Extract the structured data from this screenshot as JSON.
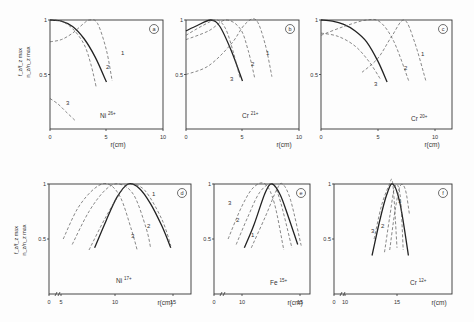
{
  "figure": {
    "y_axis_label": "f_z/f_z,max · n_z/n_z,max",
    "x_axis_label": "r(cm)"
  },
  "chart_data": [
    {
      "type": "line",
      "panel": "a",
      "ion": "Ni",
      "charge": "26+",
      "xlabel": "r(cm)",
      "ylabel": "f_z/f_z max, n_z/n_z max",
      "xlim": [
        0,
        10
      ],
      "ylim": [
        0,
        1
      ],
      "x_ticks": [
        "0",
        "5",
        "10"
      ],
      "y_ticks": [
        "0.5",
        "1"
      ],
      "axis_break": false,
      "series": [
        {
          "name": "n_z/n_z max (solid)",
          "style": "solid",
          "x": [
            0,
            1,
            2,
            3,
            4,
            5
          ],
          "y": [
            1.0,
            0.99,
            0.94,
            0.83,
            0.66,
            0.43
          ]
        },
        {
          "name": "1",
          "style": "dashed",
          "x": [
            0,
            1,
            2,
            3,
            3.5,
            4.2,
            5,
            5.5
          ],
          "y": [
            0.8,
            0.82,
            0.88,
            0.97,
            1.0,
            0.97,
            0.72,
            0.44
          ]
        },
        {
          "name": "2",
          "style": "dashed",
          "x": [
            0,
            1,
            2,
            3,
            3.6,
            4.1
          ],
          "y": [
            1.0,
            0.99,
            0.92,
            0.78,
            0.6,
            0.38
          ]
        },
        {
          "name": "3",
          "style": "dashed",
          "x": [
            0,
            0.7,
            1.4,
            2.2
          ],
          "y": [
            0.28,
            0.23,
            0.16,
            0.08
          ]
        }
      ]
    },
    {
      "type": "line",
      "panel": "b",
      "ion": "Cr",
      "charge": "21+",
      "xlabel": "r(cm)",
      "xlim": [
        0,
        10
      ],
      "ylim": [
        0,
        1
      ],
      "x_ticks": [
        "0",
        "5",
        "10"
      ],
      "y_ticks": [
        "0.5",
        "1"
      ],
      "axis_break": false,
      "series": [
        {
          "name": "n_z/n_z max (solid)",
          "style": "solid",
          "x": [
            0,
            1,
            2.2,
            3,
            4,
            5
          ],
          "y": [
            0.9,
            0.95,
            1.0,
            0.94,
            0.72,
            0.44
          ]
        },
        {
          "name": "1",
          "style": "dashed",
          "x": [
            0,
            2,
            4,
            5.2,
            6.2,
            7,
            7.6
          ],
          "y": [
            0.5,
            0.58,
            0.78,
            0.96,
            1.0,
            0.78,
            0.48
          ]
        },
        {
          "name": "2",
          "style": "dashed",
          "x": [
            0,
            2,
            3.5,
            4.8,
            5.5,
            6.1
          ],
          "y": [
            0.82,
            0.9,
            1.0,
            0.92,
            0.72,
            0.46
          ]
        },
        {
          "name": "3",
          "style": "dashed",
          "x": [
            0,
            1.5,
            2.7,
            3.5,
            4.2,
            4.8
          ],
          "y": [
            0.86,
            0.95,
            1.0,
            0.92,
            0.7,
            0.46
          ]
        }
      ]
    },
    {
      "type": "line",
      "panel": "c",
      "ion": "Cr",
      "charge": "20+",
      "xlabel": "r(cm)",
      "xlim": [
        0,
        10
      ],
      "ylim": [
        0,
        1
      ],
      "x_ticks": [
        "0",
        "5",
        "10"
      ],
      "y_ticks": [
        "0.5",
        "1"
      ],
      "axis_break": false,
      "series": [
        {
          "name": "n_z/n_z max (solid)",
          "style": "solid",
          "x": [
            0,
            1,
            2,
            3,
            4,
            5,
            5.8
          ],
          "y": [
            1.0,
            0.99,
            0.96,
            0.9,
            0.8,
            0.62,
            0.43
          ]
        },
        {
          "name": "1",
          "style": "dashed",
          "x": [
            3.6,
            5,
            6.2,
            7.3,
            8.2,
            9.2
          ],
          "y": [
            0.52,
            0.65,
            0.85,
            1.0,
            0.8,
            0.44
          ]
        },
        {
          "name": "2",
          "style": "dashed",
          "x": [
            0,
            2,
            4,
            5.2,
            6.4,
            7.7
          ],
          "y": [
            0.86,
            0.94,
            1.0,
            0.98,
            0.8,
            0.44
          ]
        },
        {
          "name": "3",
          "style": "dashed",
          "x": [
            0,
            1.5,
            3,
            4.2,
            5.2
          ],
          "y": [
            0.88,
            0.85,
            0.76,
            0.62,
            0.46
          ]
        }
      ]
    },
    {
      "type": "line",
      "panel": "d",
      "ion": "Ni",
      "charge": "17+",
      "xlabel": "r(cm)",
      "xlim": [
        0,
        16.5
      ],
      "ylim": [
        0,
        1
      ],
      "x_ticks": [
        "0",
        "5",
        "10",
        "15"
      ],
      "y_ticks": [
        "0.5",
        "1"
      ],
      "axis_break": true,
      "series": [
        {
          "name": "n_z/n_z max (solid)",
          "style": "solid",
          "x": [
            8,
            9,
            10,
            11,
            12,
            13,
            14,
            14.8
          ],
          "y": [
            0.42,
            0.66,
            0.88,
            1.0,
            0.96,
            0.82,
            0.62,
            0.42
          ]
        },
        {
          "name": "1",
          "style": "dashed",
          "x": [
            7.5,
            9,
            10.5,
            11.2,
            12.5,
            14,
            14.8
          ],
          "y": [
            0.4,
            0.7,
            0.95,
            1.0,
            0.94,
            0.68,
            0.44
          ]
        },
        {
          "name": "2",
          "style": "dashed",
          "x": [
            6,
            7.5,
            9,
            10.2,
            11.5,
            12.6,
            13
          ],
          "y": [
            0.45,
            0.75,
            0.95,
            1.0,
            0.9,
            0.6,
            0.42
          ]
        },
        {
          "name": "3",
          "style": "dashed",
          "x": [
            5.2,
            6.5,
            8,
            9.2,
            10.3,
            11.3,
            11.8
          ],
          "y": [
            0.5,
            0.78,
            0.96,
            1.0,
            0.88,
            0.58,
            0.4
          ]
        }
      ]
    },
    {
      "type": "line",
      "panel": "e",
      "ion": "Fe",
      "charge": "15+",
      "xlabel": "r(cm)",
      "xlim": [
        0,
        16.5
      ],
      "ylim": [
        0,
        1
      ],
      "x_ticks": [
        "0",
        "10",
        "15"
      ],
      "y_ticks": [
        "0.5",
        "1"
      ],
      "axis_break": true,
      "series": [
        {
          "name": "n_z/n_z max (solid)",
          "style": "solid",
          "x": [
            10.2,
            11,
            12,
            12.6,
            13.3,
            14,
            14.8
          ],
          "y": [
            0.42,
            0.62,
            0.92,
            1.0,
            0.9,
            0.7,
            0.45
          ]
        },
        {
          "name": "1",
          "style": "dashed",
          "x": [
            10.8,
            12,
            13,
            13.5,
            14.2,
            15.1
          ],
          "y": [
            0.42,
            0.7,
            0.95,
            1.0,
            0.85,
            0.44
          ]
        },
        {
          "name": "2",
          "style": "dashed",
          "x": [
            9.5,
            10.5,
            11.5,
            12.5,
            13.2,
            14.3
          ],
          "y": [
            0.45,
            0.7,
            0.92,
            1.0,
            0.88,
            0.42
          ]
        },
        {
          "name": "3",
          "style": "dashed",
          "x": [
            8.8,
            10,
            11,
            12,
            12.8,
            13.6
          ],
          "y": [
            0.5,
            0.8,
            0.97,
            1.0,
            0.82,
            0.4
          ]
        }
      ]
    },
    {
      "type": "line",
      "panel": "f",
      "ion": "Cr",
      "charge": "12+",
      "xlabel": "r(cm)",
      "xlim": [
        0,
        20.5
      ],
      "ylim": [
        0,
        1
      ],
      "x_ticks": [
        "0",
        "10",
        "15"
      ],
      "y_ticks": [
        "0.5",
        "1"
      ],
      "axis_break": true,
      "series": [
        {
          "name": "n_z/n_z max (solid)",
          "style": "solid",
          "x": [
            12.6,
            13.3,
            14,
            14.6,
            15.3,
            16.1
          ],
          "y": [
            0.35,
            0.65,
            0.9,
            1.0,
            0.82,
            0.35
          ]
        },
        {
          "name": "1",
          "style": "dashed",
          "x": [
            14.3,
            14.8,
            15.3,
            15.8,
            16.2
          ],
          "y": [
            0.4,
            0.75,
            0.98,
            0.95,
            0.72
          ]
        },
        {
          "name": "2",
          "style": "dashed",
          "x": [
            13.8,
            14.3,
            14.8,
            15.3,
            15.6
          ],
          "y": [
            0.38,
            0.7,
            0.98,
            0.9,
            0.4
          ]
        },
        {
          "name": "3",
          "style": "dashed",
          "x": [
            12.8,
            13.5,
            14.2,
            14.6,
            15.0
          ],
          "y": [
            0.5,
            0.8,
            0.98,
            1.0,
            0.42
          ]
        }
      ]
    }
  ],
  "panels": [
    {
      "id": "a",
      "badge": "a",
      "ion": "Ni",
      "charge": "26+",
      "x_ticks": [
        "0",
        "5",
        "10"
      ],
      "y_ticks": [
        "0.5",
        "1"
      ],
      "xlabel": "r(cm)"
    },
    {
      "id": "b",
      "badge": "b",
      "ion": "Cr",
      "charge": "21+",
      "x_ticks": [
        "0",
        "5",
        "10"
      ],
      "y_ticks": [
        "0.5",
        "1"
      ],
      "xlabel": "r(cm)"
    },
    {
      "id": "c",
      "badge": "c",
      "ion": "Cr",
      "charge": "20+",
      "x_ticks": [
        "0",
        "5",
        "10"
      ],
      "y_ticks": [
        "0.5",
        "1"
      ],
      "xlabel": "r(cm)"
    },
    {
      "id": "d",
      "badge": "d",
      "ion": "Ni",
      "charge": "17+",
      "x_ticks": [
        "0",
        "5",
        "10",
        "15"
      ],
      "y_ticks": [
        "0.5",
        "1"
      ],
      "xlabel": "r(cm)"
    },
    {
      "id": "e",
      "badge": "e",
      "ion": "Fe",
      "charge": "15+",
      "x_ticks": [
        "0",
        "10",
        "15"
      ],
      "y_ticks": [
        "0.5",
        "1"
      ],
      "xlabel": "r(cm)"
    },
    {
      "id": "f",
      "badge": "f",
      "ion": "Cr",
      "charge": "12+",
      "x_ticks": [
        "0",
        "10",
        "15"
      ],
      "y_ticks": [
        "0.5",
        "1"
      ],
      "xlabel": "r(cm)"
    }
  ],
  "curve_labels": [
    "1",
    "2",
    "3"
  ]
}
